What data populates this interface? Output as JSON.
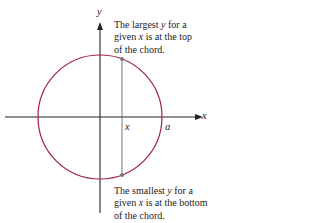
{
  "diagram": {
    "axes": {
      "x_label": "x",
      "y_label": "y"
    },
    "points": {
      "chord_x_label": "x",
      "radius_label": "a"
    },
    "top_note": {
      "line1_a": "The largest ",
      "line1_var": "y",
      "line1_b": " for a",
      "line2_a": "given ",
      "line2_var": "x",
      "line2_b": " is at the top",
      "line3": "of the chord."
    },
    "bottom_note": {
      "line1_a": "The smallest ",
      "line1_var": "y",
      "line1_b": " for a",
      "line2_a": "given ",
      "line2_var": "x",
      "line2_b": " is at the bottom",
      "line3": "of the chord."
    },
    "colors": {
      "circle": "#a0203c",
      "axis": "#222222",
      "chord": "#666666",
      "point": "#777777"
    }
  }
}
